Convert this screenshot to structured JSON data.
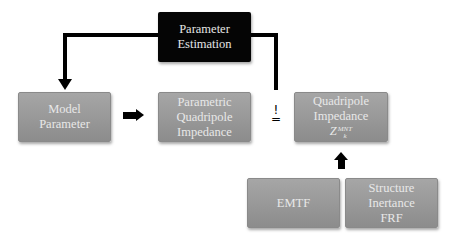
{
  "diagram": {
    "estimation": {
      "line1": "Parameter",
      "line2": "Estimation"
    },
    "model": {
      "line1": "Model",
      "line2": "Parameter"
    },
    "parametric": {
      "line1": "Parametric",
      "line2": "Quadripole",
      "line3": "Impedance"
    },
    "measured": {
      "line1": "Quadripole",
      "line2": "Impedance",
      "symbol_base": "Z",
      "symbol_sup": "MNT",
      "symbol_sub": "k"
    },
    "emtf": {
      "label": "EMTF"
    },
    "structure": {
      "line1": "Structure",
      "line2": "Inertance",
      "line3": "FRF"
    },
    "comparison": {
      "mark": "!",
      "equals": "="
    },
    "colors": {
      "box_gray": "#999999",
      "box_black": "#050505",
      "text_light": "#e8e8e8",
      "arrow": "#000000"
    }
  }
}
